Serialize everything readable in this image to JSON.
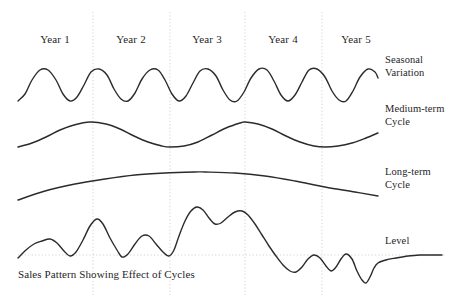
{
  "figure": {
    "caption": "Sales Pattern Showing Effect of Cycles",
    "background_color": "#ffffff",
    "curve_color": "#2b2b2b",
    "gridline_color": "#c8c8c8",
    "text_color": "#262626"
  },
  "year_labels": [
    {
      "text": "Year 1",
      "x": 55,
      "y": 33
    },
    {
      "text": "Year 2",
      "x": 131,
      "y": 33
    },
    {
      "text": "Year 3",
      "x": 207,
      "y": 33
    },
    {
      "text": "Year 4",
      "x": 283,
      "y": 33
    },
    {
      "text": "Year 5",
      "x": 356,
      "y": 33
    }
  ],
  "series_labels": [
    {
      "id": "seasonal-variation",
      "line1": "Seasonal",
      "line2": "Variation",
      "x": 385,
      "y": 54
    },
    {
      "id": "medium-term-cycle",
      "line1": "Medium-term",
      "line2": "Cycle",
      "x": 385,
      "y": 103
    },
    {
      "id": "long-term-cycle",
      "line1": "Long-term",
      "line2": "Cycle",
      "x": 385,
      "y": 166
    },
    {
      "id": "level",
      "line1": "Level",
      "line2": "",
      "x": 385,
      "y": 235
    }
  ],
  "chart_data": {
    "type": "line",
    "title": "Sales Pattern Showing Effect of Cycles",
    "xlabel": "",
    "ylabel": "",
    "grid": true,
    "legend_position": "right-inline",
    "x_axis": {
      "categories": [
        "Year 1",
        "Year 2",
        "Year 3",
        "Year 4",
        "Year 5"
      ],
      "gridlines_x_px": [
        93,
        170,
        245,
        322
      ],
      "range_px": [
        18,
        378
      ]
    },
    "horizontal_gridline_y_px": 255,
    "series": [
      {
        "name": "Seasonal Variation",
        "description": "Regular high-frequency sinusoid, about two cycles per year, constant amplitude",
        "baseline_y_px": 85,
        "amplitude_px": 16,
        "cycles_per_year": 2,
        "points": [
          [
            18,
            101
          ],
          [
            25,
            94
          ],
          [
            32,
            80
          ],
          [
            40,
            70
          ],
          [
            48,
            70
          ],
          [
            56,
            80
          ],
          [
            63,
            94
          ],
          [
            70,
            101
          ],
          [
            77,
            97
          ],
          [
            84,
            85
          ],
          [
            91,
            72
          ],
          [
            99,
            69
          ],
          [
            107,
            75
          ],
          [
            114,
            89
          ],
          [
            121,
            99
          ],
          [
            128,
            101
          ],
          [
            135,
            93
          ],
          [
            142,
            79
          ],
          [
            150,
            70
          ],
          [
            158,
            70
          ],
          [
            165,
            80
          ],
          [
            172,
            94
          ],
          [
            179,
            101
          ],
          [
            186,
            96
          ],
          [
            193,
            83
          ],
          [
            200,
            71
          ],
          [
            208,
            69
          ],
          [
            216,
            76
          ],
          [
            223,
            90
          ],
          [
            230,
            100
          ],
          [
            237,
            101
          ],
          [
            244,
            92
          ],
          [
            251,
            78
          ],
          [
            259,
            69
          ],
          [
            267,
            70
          ],
          [
            274,
            81
          ],
          [
            281,
            95
          ],
          [
            288,
            101
          ],
          [
            295,
            95
          ],
          [
            302,
            82
          ],
          [
            309,
            70
          ],
          [
            317,
            69
          ],
          [
            325,
            77
          ],
          [
            332,
            91
          ],
          [
            339,
            100
          ],
          [
            346,
            101
          ],
          [
            353,
            91
          ],
          [
            360,
            77
          ],
          [
            368,
            69
          ],
          [
            375,
            72
          ],
          [
            378,
            78
          ]
        ]
      },
      {
        "name": "Medium-term Cycle",
        "description": "Smooth wave with period of roughly 2 years; peaks near Year 1/2 boundary and mid Year 3",
        "peaks_x_px": [
          90,
          245
        ],
        "troughs_x_px": [
          170,
          325
        ],
        "points": [
          [
            18,
            147
          ],
          [
            32,
            143
          ],
          [
            46,
            137
          ],
          [
            60,
            130
          ],
          [
            74,
            125
          ],
          [
            90,
            122
          ],
          [
            106,
            124
          ],
          [
            120,
            129
          ],
          [
            134,
            136
          ],
          [
            148,
            142
          ],
          [
            162,
            146
          ],
          [
            170,
            147
          ],
          [
            184,
            146
          ],
          [
            198,
            142
          ],
          [
            212,
            135
          ],
          [
            226,
            128
          ],
          [
            240,
            123
          ],
          [
            245,
            122
          ],
          [
            258,
            124
          ],
          [
            272,
            129
          ],
          [
            286,
            136
          ],
          [
            300,
            142
          ],
          [
            314,
            146
          ],
          [
            325,
            147
          ],
          [
            338,
            146
          ],
          [
            352,
            143
          ],
          [
            366,
            138
          ],
          [
            378,
            133
          ]
        ]
      },
      {
        "name": "Long-term Cycle",
        "description": "Very broad single arc peaking around mid Year 3",
        "peak_x_px": 205,
        "points": [
          [
            18,
            200
          ],
          [
            45,
            191
          ],
          [
            75,
            184
          ],
          [
            105,
            179
          ],
          [
            135,
            175
          ],
          [
            165,
            173
          ],
          [
            195,
            172
          ],
          [
            205,
            172
          ],
          [
            235,
            173
          ],
          [
            265,
            176
          ],
          [
            295,
            181
          ],
          [
            325,
            187
          ],
          [
            355,
            192
          ],
          [
            378,
            196
          ]
        ]
      },
      {
        "name": "Level",
        "description": "Composite sales pattern combining seasonal, medium-term and long-term effects; rises to peak mid Year 3 then falls sharply in Years 4-5 before a final recovery toward the level line",
        "points": [
          [
            18,
            258
          ],
          [
            26,
            250
          ],
          [
            34,
            244
          ],
          [
            42,
            241
          ],
          [
            50,
            239
          ],
          [
            57,
            243
          ],
          [
            64,
            251
          ],
          [
            70,
            256
          ],
          [
            76,
            252
          ],
          [
            83,
            240
          ],
          [
            90,
            226
          ],
          [
            97,
            219
          ],
          [
            103,
            224
          ],
          [
            110,
            238
          ],
          [
            117,
            250
          ],
          [
            122,
            257
          ],
          [
            128,
            254
          ],
          [
            135,
            244
          ],
          [
            142,
            236
          ],
          [
            149,
            236
          ],
          [
            156,
            244
          ],
          [
            163,
            252
          ],
          [
            169,
            256
          ],
          [
            174,
            250
          ],
          [
            179,
            236
          ],
          [
            185,
            221
          ],
          [
            191,
            211
          ],
          [
            197,
            207
          ],
          [
            203,
            210
          ],
          [
            209,
            218
          ],
          [
            215,
            224
          ],
          [
            221,
            223
          ],
          [
            228,
            217
          ],
          [
            235,
            212
          ],
          [
            242,
            211
          ],
          [
            248,
            215
          ],
          [
            255,
            224
          ],
          [
            262,
            235
          ],
          [
            269,
            246
          ],
          [
            276,
            256
          ],
          [
            283,
            265
          ],
          [
            290,
            271
          ],
          [
            296,
            272
          ],
          [
            302,
            267
          ],
          [
            308,
            259
          ],
          [
            314,
            255
          ],
          [
            320,
            258
          ],
          [
            326,
            266
          ],
          [
            331,
            271
          ],
          [
            336,
            267
          ],
          [
            341,
            259
          ],
          [
            346,
            254
          ],
          [
            352,
            259
          ],
          [
            357,
            271
          ],
          [
            362,
            280
          ],
          [
            366,
            283
          ],
          [
            370,
            277
          ],
          [
            374,
            268
          ],
          [
            378,
            263
          ],
          [
            386,
            260
          ],
          [
            396,
            258
          ],
          [
            408,
            256
          ],
          [
            420,
            255
          ],
          [
            432,
            255
          ],
          [
            442,
            255
          ]
        ]
      }
    ]
  }
}
